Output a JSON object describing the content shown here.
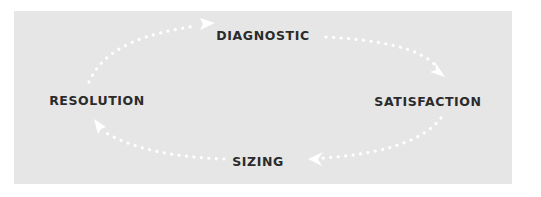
{
  "diagram": {
    "type": "cycle",
    "background_color": "#e6e6e6",
    "label_color": "#2b2b2b",
    "arrow_color": "#ffffff",
    "nodes": [
      {
        "id": "diagnostic",
        "label": "DIAGNOSTIC"
      },
      {
        "id": "satisfaction",
        "label": "SATISFACTION"
      },
      {
        "id": "sizing",
        "label": "SIZING"
      },
      {
        "id": "resolution",
        "label": "RESOLUTION"
      }
    ],
    "edges": [
      {
        "from": "diagnostic",
        "to": "satisfaction",
        "style": "dotted"
      },
      {
        "from": "satisfaction",
        "to": "sizing",
        "style": "dotted"
      },
      {
        "from": "sizing",
        "to": "resolution",
        "style": "dotted"
      },
      {
        "from": "resolution",
        "to": "diagnostic",
        "style": "dotted"
      }
    ]
  }
}
